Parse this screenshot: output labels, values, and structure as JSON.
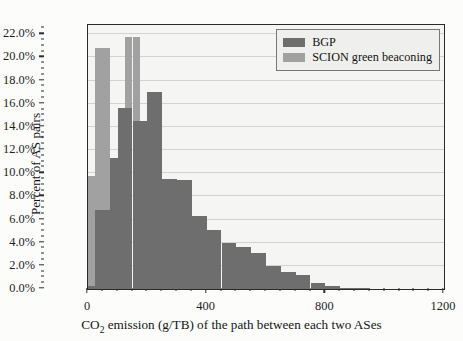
{
  "chart_data": {
    "type": "bar",
    "title": "",
    "subtitle": "",
    "xlabel": "CO2 emission (g/TB) of the path between each two ASes",
    "xlabel_parts": {
      "pre": "CO",
      "sub": "2",
      "post": " emission (g/TB) of the path between each two ASes"
    },
    "ylabel": "Percent of AS pairs",
    "xlim": [
      0,
      1200
    ],
    "ylim": [
      0,
      22.8
    ],
    "grid": "horizontal",
    "legend_position": "top-right",
    "xtick_labels": [
      "0",
      "400",
      "800",
      "1200"
    ],
    "xtick_values": [
      0,
      400,
      800,
      1200
    ],
    "xminor_step": 50,
    "ytick_labels": [
      "0.0%",
      "2.0%",
      "4.0%",
      "6.0%",
      "8.0%",
      "10.0%",
      "12.0%",
      "14.0%",
      "16.0%",
      "18.0%",
      "20.0%",
      "22.0%"
    ],
    "ytick_values": [
      0,
      2,
      4,
      6,
      8,
      10,
      12,
      14,
      16,
      18,
      20,
      22
    ],
    "yminor_step": 0.5,
    "bin_width": 25,
    "series": [
      {
        "name": "BGP",
        "color": "#6e6e6e",
        "bin_starts": [
          0,
          25,
          50,
          75,
          100,
          125,
          150,
          175,
          200,
          225,
          250,
          275,
          300,
          325,
          350,
          375,
          400,
          425,
          450,
          475,
          500,
          525,
          550,
          575,
          600,
          625,
          650,
          675,
          700,
          725,
          750,
          775,
          800,
          825,
          850,
          875,
          900,
          925,
          950,
          975
        ],
        "values": [
          0.25,
          6.8,
          6.8,
          11.3,
          15.6,
          15.6,
          14.5,
          14.5,
          17.0,
          17.0,
          9.5,
          9.5,
          9.4,
          9.4,
          6.3,
          6.3,
          5.1,
          5.1,
          4.0,
          4.0,
          3.6,
          3.6,
          3.1,
          3.1,
          2.0,
          2.0,
          1.5,
          1.5,
          1.2,
          1.2,
          0.55,
          0.55,
          0.3,
          0.3,
          0.12,
          0.12,
          0.07,
          0.07,
          0.03,
          0.03
        ]
      },
      {
        "name": "SCION green beaconing",
        "color": "#a1a1a1",
        "bin_starts": [
          0,
          25,
          50,
          75,
          100,
          125,
          150,
          175,
          200
        ],
        "values": [
          9.8,
          20.8,
          20.8,
          11.3,
          11.3,
          21.8,
          21.8,
          9.2,
          9.2
        ]
      }
    ]
  },
  "legend": {
    "items": [
      {
        "label": "BGP",
        "color": "#6e6e6e"
      },
      {
        "label": "SCION green beaconing",
        "color": "#a1a1a1"
      }
    ]
  }
}
